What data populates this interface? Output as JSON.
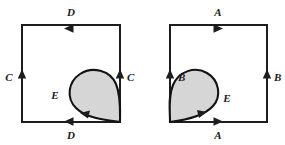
{
  "figure": {
    "type": "topological-identification-diagram",
    "background_color": "#ffffff",
    "line_color": "#1d1d1d",
    "shade_color": "#d6d6d6",
    "panels": [
      {
        "id": "left-panel",
        "square": {
          "x": 22,
          "y": 25,
          "width": 98,
          "height": 97
        },
        "edges": [
          {
            "side": "top",
            "label": "D",
            "arrow_direction": "left",
            "label_x": 71,
            "label_y": 16
          },
          {
            "side": "bottom",
            "label": "D",
            "arrow_direction": "left",
            "label_x": 71,
            "label_y": 139
          },
          {
            "side": "left",
            "label": "C",
            "arrow_direction": "up",
            "label_x": 9,
            "label_y": 78
          },
          {
            "side": "right",
            "label": "C",
            "arrow_direction": "up",
            "label_x": 127,
            "label_y": 78
          }
        ],
        "loop": {
          "label": "E",
          "label_x": 55,
          "label_y": 96,
          "basepoint": "bottom-right-corner",
          "bulge": "upper-left",
          "arrow_direction": "left"
        }
      },
      {
        "id": "right-panel",
        "square": {
          "x": 170,
          "y": 25,
          "width": 97,
          "height": 97
        },
        "edges": [
          {
            "side": "top",
            "label": "A",
            "arrow_direction": "right",
            "label_x": 218,
            "label_y": 16
          },
          {
            "side": "bottom",
            "label": "A",
            "arrow_direction": "right",
            "label_x": 218,
            "label_y": 139
          },
          {
            "side": "left",
            "label": "B",
            "arrow_direction": "up",
            "label_x": 178,
            "label_y": 78
          },
          {
            "side": "right",
            "label": "B",
            "arrow_direction": "up",
            "label_x": 274,
            "label_y": 78
          }
        ],
        "loop": {
          "label": "E",
          "label_x": 227,
          "label_y": 99,
          "basepoint": "bottom-left-corner",
          "bulge": "upper-right",
          "arrow_direction": "right"
        }
      }
    ]
  }
}
